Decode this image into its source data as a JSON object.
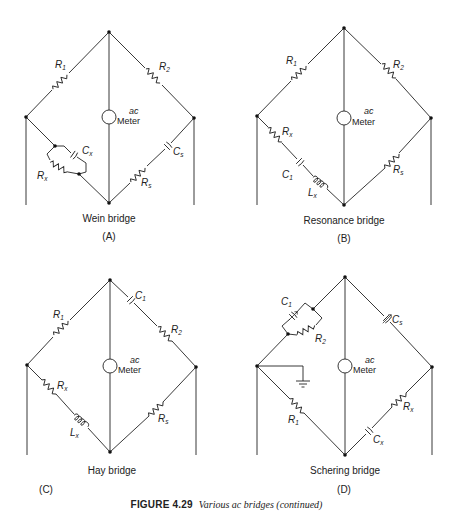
{
  "figure": {
    "number_label": "FIGURE 4.29",
    "caption": "Various ac bridges (continued)"
  },
  "meter": {
    "line1": "ac",
    "line2": "Meter"
  },
  "diagrams": [
    {
      "id": "A",
      "panel_label": "(A)",
      "title": "Wein bridge",
      "components": {
        "r1": {
          "main": "R",
          "sub": "1"
        },
        "r2": {
          "main": "R",
          "sub": "2"
        },
        "cx": {
          "main": "C",
          "sub": "x"
        },
        "rx": {
          "main": "R",
          "sub": "x"
        },
        "cs": {
          "main": "C",
          "sub": "s"
        },
        "rs": {
          "main": "R",
          "sub": "s"
        }
      }
    },
    {
      "id": "B",
      "panel_label": "(B)",
      "title": "Resonance bridge",
      "components": {
        "r1": {
          "main": "R",
          "sub": "1"
        },
        "r2": {
          "main": "R",
          "sub": "2"
        },
        "rx": {
          "main": "R",
          "sub": "x"
        },
        "c1": {
          "main": "C",
          "sub": "1"
        },
        "lx": {
          "main": "L",
          "sub": "x"
        },
        "rs": {
          "main": "R",
          "sub": "s"
        }
      }
    },
    {
      "id": "C",
      "panel_label": "(C)",
      "title": "Hay bridge",
      "components": {
        "r1": {
          "main": "R",
          "sub": "1"
        },
        "c1": {
          "main": "C",
          "sub": "1"
        },
        "r2": {
          "main": "R",
          "sub": "2"
        },
        "rx": {
          "main": "R",
          "sub": "x"
        },
        "lx": {
          "main": "L",
          "sub": "x"
        },
        "rs": {
          "main": "R",
          "sub": "s"
        }
      }
    },
    {
      "id": "D",
      "panel_label": "(D)",
      "title": "Schering bridge",
      "components": {
        "c1": {
          "main": "C",
          "sub": "1"
        },
        "r2": {
          "main": "R",
          "sub": "2"
        },
        "cs": {
          "main": "C",
          "sub": "s"
        },
        "r1": {
          "main": "R",
          "sub": "1"
        },
        "rx": {
          "main": "R",
          "sub": "x"
        },
        "cx": {
          "main": "C",
          "sub": "x"
        }
      }
    }
  ]
}
